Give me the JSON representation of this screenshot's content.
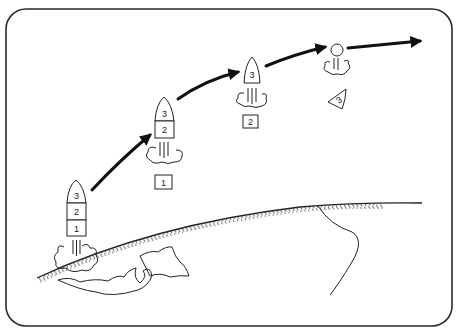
{
  "diagram": {
    "colors": {
      "line": "#222222",
      "background": "#ffffff",
      "trajectory": "#111111"
    },
    "rocket_launch": {
      "stages": [
        {
          "label": "3"
        },
        {
          "label": "2"
        },
        {
          "label": "1"
        }
      ]
    },
    "rocket_second": {
      "stages": [
        {
          "label": "3"
        },
        {
          "label": "2"
        }
      ],
      "jettisoned_stage_label": "1"
    },
    "rocket_third": {
      "stages": [
        {
          "label": "3"
        }
      ],
      "jettisoned_stage_label": "2"
    },
    "payload": {
      "jettisoned_stage_label": "3"
    }
  }
}
